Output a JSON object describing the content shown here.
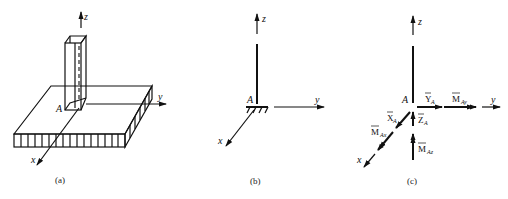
{
  "figure": {
    "panels": [
      {
        "id": "a",
        "caption": "(a)",
        "description": "Column fixed in a slab",
        "axes": {
          "z": "z",
          "y": "y",
          "x": "x"
        },
        "point": "A"
      },
      {
        "id": "b",
        "caption": "(b)",
        "description": "Fixed support schematic",
        "axes": {
          "z": "z",
          "y": "y",
          "x": "x"
        },
        "point": "A"
      },
      {
        "id": "c",
        "caption": "(c)",
        "description": "Support reactions",
        "axes": {
          "z": "z",
          "y": "y",
          "x": "x"
        },
        "point": "A",
        "reactions": {
          "YA": {
            "main": "Y",
            "sub": "A"
          },
          "MAy": {
            "main": "M",
            "sub": "Ay"
          },
          "XA": {
            "main": "X",
            "sub": "A"
          },
          "ZA": {
            "main": "Z",
            "sub": "A"
          },
          "MAx": {
            "main": "M",
            "sub": "Ax"
          },
          "MAz": {
            "main": "M",
            "sub": "Az"
          }
        }
      }
    ]
  }
}
